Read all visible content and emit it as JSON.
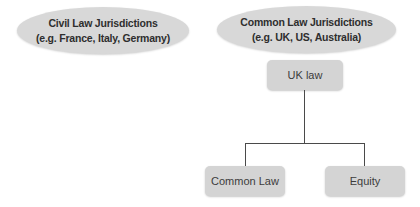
{
  "diagram": {
    "civil_ellipse": {
      "line1": "Civil Law Jurisdictions",
      "line2": "(e.g. France, Italy, Germany)"
    },
    "common_ellipse": {
      "line1": "Common Law Jurisdictions",
      "line2": "(e.g. UK, US, Australia)"
    },
    "uk_law_box": {
      "label": "UK law"
    },
    "common_law_box": {
      "label": "Common Law"
    },
    "equity_box": {
      "label": "Equity"
    },
    "colors": {
      "shape_fill_ellipse": "#d8d8d8",
      "shape_fill_box": "#d4d4d4",
      "text": "#2e2e2e",
      "connector_line": "#4a4a4a",
      "background": "#ffffff"
    }
  }
}
